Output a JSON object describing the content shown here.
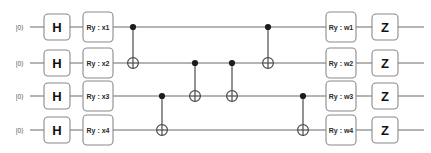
{
  "figure": {
    "kind": "quantum-circuit-diagram",
    "num_qubits": 4,
    "background_color": "#ffffff",
    "wire_color": "#6b6b6b",
    "gate_border_color": "#8a8a8a",
    "gate_fill_color": "#ffffff",
    "control_dot_color": "#1c1c1c"
  },
  "qubits": [
    {
      "index": 0,
      "init_label": "|0⟩",
      "wire_y": 27
    },
    {
      "index": 1,
      "init_label": "|0⟩",
      "wire_y": 63
    },
    {
      "index": 2,
      "init_label": "|0⟩",
      "wire_y": 96
    },
    {
      "index": 3,
      "init_label": "|0⟩",
      "wire_y": 130
    }
  ],
  "columns": {
    "hadamard_x": 57,
    "ry_input_x": 98,
    "ry_weight_x": 341,
    "pauli_z_x": 385,
    "cnot_x": [
      133,
      162,
      195,
      232,
      268,
      303
    ]
  },
  "gates": {
    "hadamard": [
      {
        "label": "H",
        "qubit": 0
      },
      {
        "label": "H",
        "qubit": 1
      },
      {
        "label": "H",
        "qubit": 2
      },
      {
        "label": "H",
        "qubit": 3
      }
    ],
    "ry_input": [
      {
        "label": "Ry : x1",
        "qubit": 0
      },
      {
        "label": "Ry : x2",
        "qubit": 1
      },
      {
        "label": "Ry : x3",
        "qubit": 2
      },
      {
        "label": "Ry : x4",
        "qubit": 3
      }
    ],
    "ry_weight": [
      {
        "label": "Ry : w1",
        "qubit": 0
      },
      {
        "label": "Ry : w2",
        "qubit": 1
      },
      {
        "label": "Ry : w3",
        "qubit": 2
      },
      {
        "label": "Ry : w4",
        "qubit": 3
      }
    ],
    "pauli_z": [
      {
        "label": "Z",
        "qubit": 0
      },
      {
        "label": "Z",
        "qubit": 1
      },
      {
        "label": "Z",
        "qubit": 2
      },
      {
        "label": "Z",
        "qubit": 3
      }
    ],
    "cnots": [
      {
        "order": 1,
        "control_qubit": 0,
        "target_qubit": 1,
        "x": 133
      },
      {
        "order": 2,
        "control_qubit": 2,
        "target_qubit": 3,
        "x": 162
      },
      {
        "order": 3,
        "control_qubit": 1,
        "target_qubit": 2,
        "x": 195
      },
      {
        "order": 4,
        "control_qubit": 1,
        "target_qubit": 2,
        "x": 232
      },
      {
        "order": 5,
        "control_qubit": 0,
        "target_qubit": 1,
        "x": 268
      },
      {
        "order": 6,
        "control_qubit": 2,
        "target_qubit": 3,
        "x": 303
      }
    ]
  }
}
